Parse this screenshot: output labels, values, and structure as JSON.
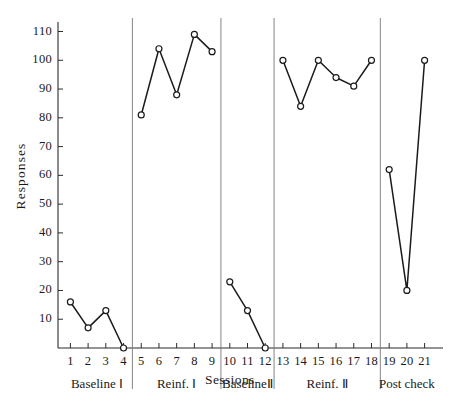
{
  "chart_data": {
    "type": "line",
    "title": "",
    "xlabel": "Sessions",
    "ylabel": "Responses",
    "xlim": [
      0.3,
      21.7
    ],
    "ylim": [
      0,
      114
    ],
    "grid": false,
    "legend": "none",
    "marker": "open-circle",
    "y_ticks": [
      10,
      20,
      30,
      40,
      50,
      60,
      70,
      80,
      90,
      100,
      110
    ],
    "x_ticks": [
      1,
      2,
      3,
      4,
      5,
      6,
      7,
      8,
      9,
      10,
      11,
      12,
      13,
      14,
      15,
      16,
      17,
      18,
      19,
      20,
      21
    ],
    "x_tick_labels": [
      "1",
      "2",
      "3",
      "4",
      "5",
      "6",
      "7",
      "8",
      "9",
      "10",
      "11",
      "12",
      "13",
      "14",
      "15",
      "16",
      "17",
      "18",
      "19",
      "20",
      "21"
    ],
    "y_tick_labels": [
      "10",
      "20",
      "30",
      "40",
      "50",
      "60",
      "70",
      "80",
      "90",
      "100",
      "110"
    ],
    "phase_separators": [
      4.5,
      9.5,
      12.5,
      18.5
    ],
    "phases": [
      {
        "label": "Baseline Ⅰ",
        "x_start": 1,
        "x_end": 4
      },
      {
        "label": "Reinf. Ⅰ",
        "x_start": 5,
        "x_end": 9
      },
      {
        "label": "BaselineⅡ",
        "x_start": 10,
        "x_end": 12
      },
      {
        "label": "Reinf. Ⅱ",
        "x_start": 13,
        "x_end": 18
      },
      {
        "label": "Post check",
        "x_start": 19,
        "x_end": 21
      }
    ],
    "series": [
      {
        "name": "Baseline I",
        "x": [
          1,
          2,
          3,
          4
        ],
        "values": [
          16,
          7,
          13,
          0
        ]
      },
      {
        "name": "Reinf. I",
        "x": [
          5,
          6,
          7,
          8,
          9
        ],
        "values": [
          81,
          104,
          88,
          109,
          103
        ]
      },
      {
        "name": "Baseline II",
        "x": [
          10,
          11,
          12
        ],
        "values": [
          23,
          13,
          0
        ]
      },
      {
        "name": "Reinf. II",
        "x": [
          13,
          14,
          15,
          16,
          17,
          18
        ],
        "values": [
          100,
          84,
          100,
          94,
          91,
          100
        ]
      },
      {
        "name": "Post check",
        "x": [
          19,
          20,
          21
        ],
        "values": [
          62,
          20,
          100
        ]
      }
    ]
  }
}
